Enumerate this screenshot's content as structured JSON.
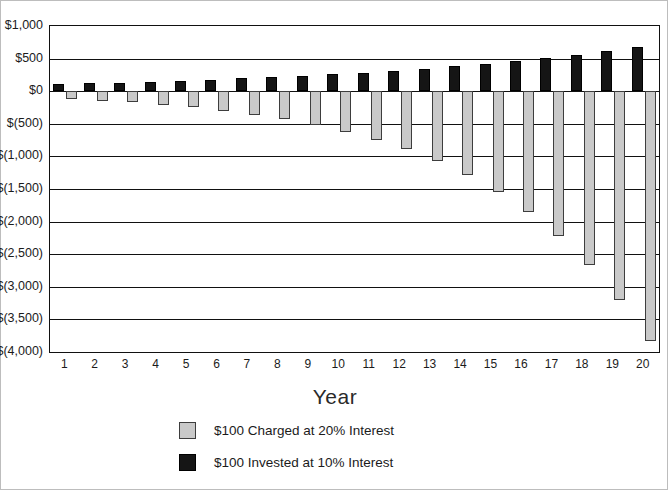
{
  "chart_data": {
    "type": "bar",
    "title": "",
    "xlabel": "Year",
    "ylabel": "",
    "categories": [
      "1",
      "2",
      "3",
      "4",
      "5",
      "6",
      "7",
      "8",
      "9",
      "10",
      "11",
      "12",
      "13",
      "14",
      "15",
      "16",
      "17",
      "18",
      "19",
      "20"
    ],
    "ylim": [
      -4000,
      1000
    ],
    "ytick_values": [
      1000,
      500,
      0,
      -500,
      -1000,
      -1500,
      -2000,
      -2500,
      -3000,
      -3500,
      -4000
    ],
    "ytick_labels": [
      "$1,000",
      "$500",
      "$0",
      "$(500)",
      "$(1,000)",
      "$(1,500)",
      "$(2,000)",
      "$(2,500)",
      "$(3,000)",
      "$(3,500)",
      "$(4,000)"
    ],
    "grid": true,
    "legend_position": "bottom-left",
    "series": [
      {
        "name": "$100 Invested at 10% Interest",
        "color": "#151515",
        "values": [
          110,
          121,
          133,
          146,
          161,
          177,
          195,
          214,
          236,
          259,
          285,
          314,
          345,
          380,
          418,
          459,
          505,
          556,
          612,
          673
        ]
      },
      {
        "name": "$100 Charged at 20% Interest",
        "color": "#c9c9c9",
        "values": [
          -120,
          -144,
          -173,
          -207,
          -249,
          -299,
          -358,
          -430,
          -516,
          -619,
          -743,
          -892,
          -1070,
          -1284,
          -1541,
          -1849,
          -2219,
          -2662,
          -3195,
          -3834
        ]
      }
    ]
  },
  "axis": {
    "x_title": "Year"
  },
  "legend": {
    "items": [
      {
        "label": "$100 Charged at 20% Interest",
        "swatch": "charged"
      },
      {
        "label": "$100 Invested at 10% Interest",
        "swatch": "invested"
      }
    ]
  }
}
